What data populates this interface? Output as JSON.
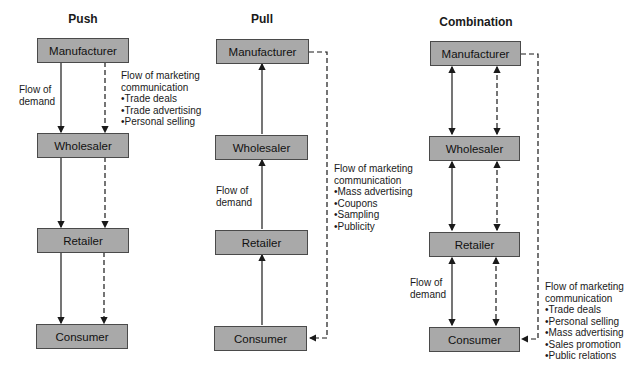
{
  "columns": [
    {
      "title": "Push",
      "nodes": [
        "Manufacturer",
        "Wholesaler",
        "Retailer",
        "Consumer"
      ],
      "demand_label": [
        "Flow of",
        "demand"
      ],
      "communication_label": {
        "heading": [
          "Flow of marketing",
          "communication"
        ],
        "items": [
          "Trade deals",
          "Trade advertising",
          "Personal selling"
        ]
      }
    },
    {
      "title": "Pull",
      "nodes": [
        "Manufacturer",
        "Wholesaler",
        "Retailer",
        "Consumer"
      ],
      "demand_label": [
        "Flow of",
        "demand"
      ],
      "communication_label": {
        "heading": [
          "Flow of marketing",
          "communication"
        ],
        "items": [
          "Mass advertising",
          "Coupons",
          "Sampling",
          "Publicity"
        ]
      }
    },
    {
      "title": "Combination",
      "nodes": [
        "Manufacturer",
        "Wholesaler",
        "Retailer",
        "Consumer"
      ],
      "demand_label": [
        "Flow of",
        "demand"
      ],
      "communication_label": {
        "heading": [
          "Flow of marketing",
          "communication"
        ],
        "items": [
          "Trade deals",
          "Personal selling",
          "Mass advertising",
          "Sales promotion",
          "Public relations"
        ]
      }
    }
  ],
  "colors": {
    "box_fill": "#a9a9a9",
    "box_border": "#4a4a4a",
    "line": "#1a1a1a"
  }
}
